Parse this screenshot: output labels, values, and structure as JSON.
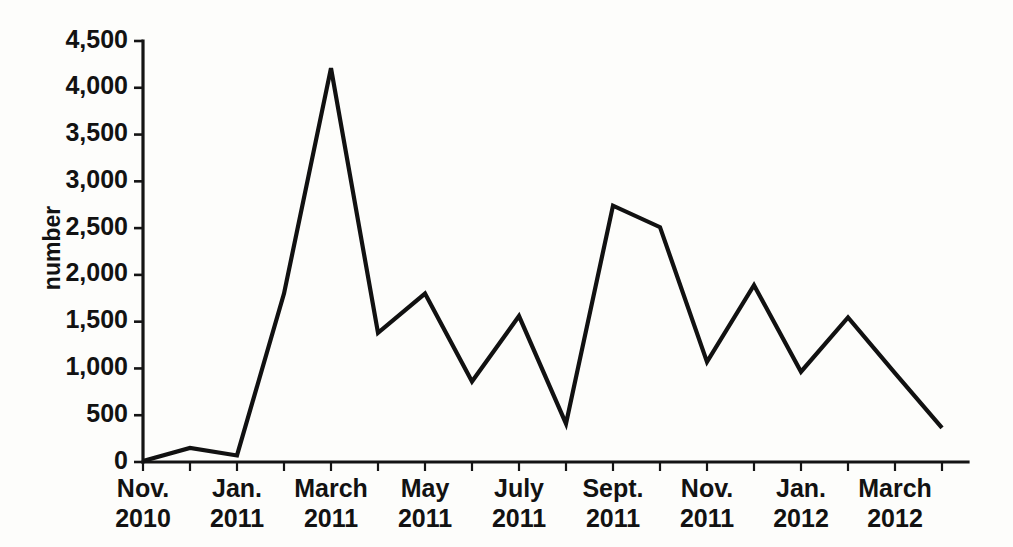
{
  "chart_data": {
    "type": "line",
    "title": "",
    "subtitle": "",
    "xlabel": "",
    "ylabel": "number",
    "ylim": [
      0,
      4500
    ],
    "ytick_step": 500,
    "yticks": [
      0,
      500,
      1000,
      1500,
      2000,
      2500,
      3000,
      3500,
      4000,
      4500
    ],
    "ytick_labels": [
      "0",
      "500",
      "1,000",
      "1,500",
      "2,000",
      "2,500",
      "3,000",
      "3,500",
      "4,000",
      "4,500"
    ],
    "grid": false,
    "legend": false,
    "legend_position": "none",
    "line_color": "#111111",
    "background_color": "#fdfdfb",
    "x_tick_interval_months": 1,
    "x_label_interval_months": 2,
    "xtick_labels": [
      {
        "line1": "Nov.",
        "line2": "2010"
      },
      {
        "line1": "Jan.",
        "line2": "2011"
      },
      {
        "line1": "March",
        "line2": "2011"
      },
      {
        "line1": "May",
        "line2": "2011"
      },
      {
        "line1": "July",
        "line2": "2011"
      },
      {
        "line1": "Sept.",
        "line2": "2011"
      },
      {
        "line1": "Nov.",
        "line2": "2011"
      },
      {
        "line1": "Jan.",
        "line2": "2012"
      },
      {
        "line1": "March",
        "line2": "2012"
      }
    ],
    "x": [
      "Nov. 2010",
      "Dec. 2010",
      "Jan. 2011",
      "Feb. 2011",
      "March 2011",
      "April 2011",
      "May 2011",
      "June 2011",
      "July 2011",
      "Aug. 2011",
      "Sept. 2011",
      "Oct. 2011",
      "Nov. 2011",
      "Dec. 2011",
      "Jan. 2012",
      "Feb. 2012",
      "March 2012",
      "April 2012"
    ],
    "values": [
      10,
      150,
      70,
      1800,
      4210,
      1380,
      1800,
      860,
      1560,
      410,
      2740,
      2510,
      1070,
      1890,
      965,
      1545,
      950,
      365
    ],
    "series": [
      {
        "name": "number",
        "values": [
          10,
          150,
          70,
          1800,
          4210,
          1380,
          1800,
          860,
          1560,
          410,
          2740,
          2510,
          1070,
          1890,
          965,
          1545,
          950,
          365
        ]
      }
    ]
  }
}
